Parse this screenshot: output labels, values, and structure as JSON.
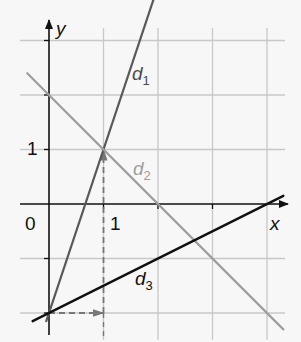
{
  "chart_data": {
    "type": "line",
    "title": "",
    "xlabel": "x",
    "ylabel": "y",
    "xlim": [
      -0.9,
      4.3
    ],
    "ylim": [
      -2.4,
      3.4
    ],
    "grid": true,
    "ticks": {
      "origin_label": "0",
      "x_tick_label": "1",
      "y_tick_label": "1"
    },
    "series": [
      {
        "name": "d1",
        "label_main": "d",
        "label_sub": "1",
        "equation": "y = 3x - 2",
        "slope": 3,
        "intercept": -2,
        "color": "#5a5a5a",
        "x": [
          -0.05,
          2.0
        ],
        "y": [
          -2.15,
          4.0
        ]
      },
      {
        "name": "d2",
        "label_main": "d",
        "label_sub": "2",
        "equation": "y = -x + 2",
        "slope": -1,
        "intercept": 2,
        "color": "#9e9e9e",
        "x": [
          -0.4,
          4.3
        ],
        "y": [
          2.4,
          -2.3
        ]
      },
      {
        "name": "d3",
        "label_main": "d",
        "label_sub": "3",
        "equation": "y = 0.5x - 2",
        "slope": 0.5,
        "intercept": -2,
        "color": "#111111",
        "x": [
          -0.3,
          4.3
        ],
        "y": [
          -2.15,
          0.15
        ]
      }
    ],
    "annotations": [
      {
        "type": "dashed-arrow",
        "from": [
          0,
          -2
        ],
        "to": [
          1,
          -2
        ],
        "meaning": "run = 1"
      },
      {
        "type": "dashed-arrow",
        "from": [
          1,
          -2
        ],
        "to": [
          1,
          1
        ],
        "meaning": "rise = 3"
      }
    ],
    "key_points": [
      {
        "x": 0,
        "y": -2
      },
      {
        "x": 1,
        "y": 1
      },
      {
        "x": 0,
        "y": 2
      },
      {
        "x": 4,
        "y": 0
      }
    ]
  },
  "colors": {
    "background": "#f7f7f7",
    "grid": "#c8c8c8",
    "axis": "#111111",
    "dashed": "#777777"
  }
}
